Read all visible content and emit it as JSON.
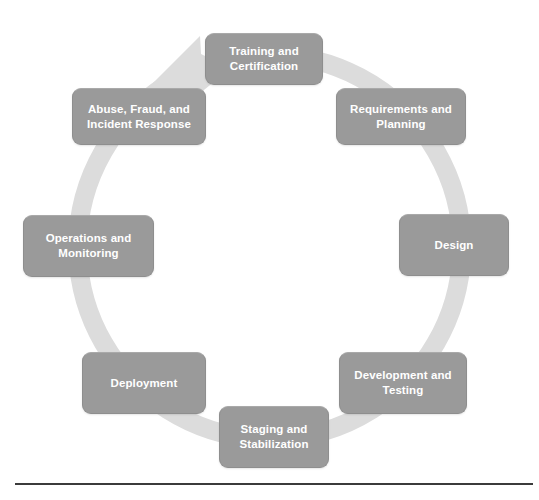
{
  "diagram": {
    "type": "cycle",
    "title": "",
    "direction": "clockwise",
    "node_count": 8,
    "colors": {
      "node_fill": "#9a9a9a",
      "node_border": "#8e8e8e",
      "node_text": "#ffffff",
      "ring": "#dcdcdc",
      "arrowhead": "#dcdcdc",
      "background": "#ffffff",
      "rule": "#3b3b3b"
    },
    "ring": {
      "center_x": 270,
      "center_y": 247,
      "outer_radius": 192,
      "band_width": 19
    },
    "nodes": [
      {
        "id": "training-and-certification",
        "label": "Training and\nCertification",
        "position": "top"
      },
      {
        "id": "requirements-and-planning",
        "label": "Requirements and\nPlanning",
        "position": "top-right"
      },
      {
        "id": "design",
        "label": "Design",
        "position": "right"
      },
      {
        "id": "development-and-testing",
        "label": "Development and\nTesting",
        "position": "bottom-right"
      },
      {
        "id": "staging-and-stabilization",
        "label": "Staging and\nStabilization",
        "position": "bottom"
      },
      {
        "id": "deployment",
        "label": "Deployment",
        "position": "bottom-left"
      },
      {
        "id": "operations-and-monitoring",
        "label": "Operations and\nMonitoring",
        "position": "left"
      },
      {
        "id": "abuse-fraud-and-incident-response",
        "label": "Abuse, Fraud, and\nIncident Response",
        "position": "top-left"
      }
    ]
  },
  "footer": {
    "rule": "horizontal-divider"
  }
}
